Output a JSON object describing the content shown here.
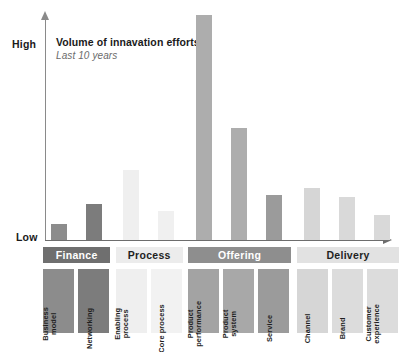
{
  "chart_data": {
    "type": "bar",
    "title": "Volume of innavation efforts",
    "subtitle": "Last 10 years",
    "xlabel": "",
    "ylabel": "",
    "ytick_labels": [
      "High",
      "Low"
    ],
    "ylim": [
      0,
      100
    ],
    "grid": false,
    "legend": "none",
    "categories": [
      "Business model",
      "Networking",
      "Enabling process",
      "Core process",
      "Product performance",
      "Product system",
      "Service",
      "Channel",
      "Brand",
      "Customer experience"
    ],
    "values": [
      7,
      16,
      31,
      13,
      100,
      50,
      20,
      23,
      19,
      11
    ],
    "bar_colors": [
      "#8c8c8c",
      "#7c7c7c",
      "#efefef",
      "#f0f0f0",
      "#adadad",
      "#adadad",
      "#9b9b9b",
      "#d6d6d6",
      "#d9d9d9",
      "#d9d9d9"
    ],
    "groups": [
      {
        "label": "Finance",
        "members": [
          "Business model",
          "Networking"
        ]
      },
      {
        "label": "Process",
        "members": [
          "Enabling process",
          "Core process"
        ]
      },
      {
        "label": "Offering",
        "members": [
          "Product performance",
          "Product system",
          "Service"
        ]
      },
      {
        "label": "Delivery",
        "members": [
          "Channel",
          "Brand",
          "Customer experience"
        ]
      }
    ]
  },
  "axis": {
    "high_label": "High",
    "low_label": "Low"
  },
  "title": {
    "main": "Volume of innavation efforts",
    "sub": "Last 10 years"
  },
  "matrix": {
    "groups": [
      {
        "label": "Finance",
        "band_bg": "#6f6f6f",
        "band_fg": "#ffffff",
        "left": 52,
        "width": 80,
        "cells": [
          {
            "lines": [
              "Business",
              "model"
            ],
            "bg": "#8c8c8c",
            "fg": "#1f1f1f",
            "left": 52,
            "width": 37
          },
          {
            "lines": [
              "Networking"
            ],
            "bg": "#7c7c7c",
            "fg": "#1f1f1f",
            "left": 94,
            "width": 37
          }
        ]
      },
      {
        "label": "Process",
        "band_bg": "#ececec",
        "band_fg": "#1f1f1f",
        "left": 139,
        "width": 80,
        "cells": [
          {
            "lines": [
              "Enabling",
              "process"
            ],
            "bg": "#efefef",
            "fg": "#1f1f1f",
            "left": 139,
            "width": 37
          },
          {
            "lines": [
              "Core process"
            ],
            "bg": "#f2f2f2",
            "fg": "#1f1f1f",
            "left": 181,
            "width": 37
          }
        ]
      },
      {
        "label": "Offering",
        "band_bg": "#8e8e8e",
        "band_fg": "#ffffff",
        "left": 226,
        "width": 123,
        "cells": [
          {
            "lines": [
              "Product",
              "performance"
            ],
            "bg": "#a3a3a3",
            "fg": "#1f1f1f",
            "left": 226,
            "width": 37
          },
          {
            "lines": [
              "Product",
              "system"
            ],
            "bg": "#a8a8a8",
            "fg": "#1f1f1f",
            "left": 268,
            "width": 37
          },
          {
            "lines": [
              "Service"
            ],
            "bg": "#9b9b9b",
            "fg": "#1f1f1f",
            "left": 310,
            "width": 37
          }
        ]
      },
      {
        "label": "Delivery",
        "band_bg": "#e2e2e2",
        "band_fg": "#1f1f1f",
        "left": 356,
        "width": 123,
        "cells": [
          {
            "lines": [
              "Channel"
            ],
            "bg": "#d6d6d6",
            "fg": "#1f1f1f",
            "left": 356,
            "width": 37
          },
          {
            "lines": [
              "Brand"
            ],
            "bg": "#dcdcdc",
            "fg": "#1f1f1f",
            "left": 398,
            "width": 37
          },
          {
            "lines": [
              "Customer",
              "experience"
            ],
            "bg": "#dcdcdc",
            "fg": "#1f1f1f",
            "left": 440,
            "width": 37
          }
        ]
      }
    ]
  }
}
